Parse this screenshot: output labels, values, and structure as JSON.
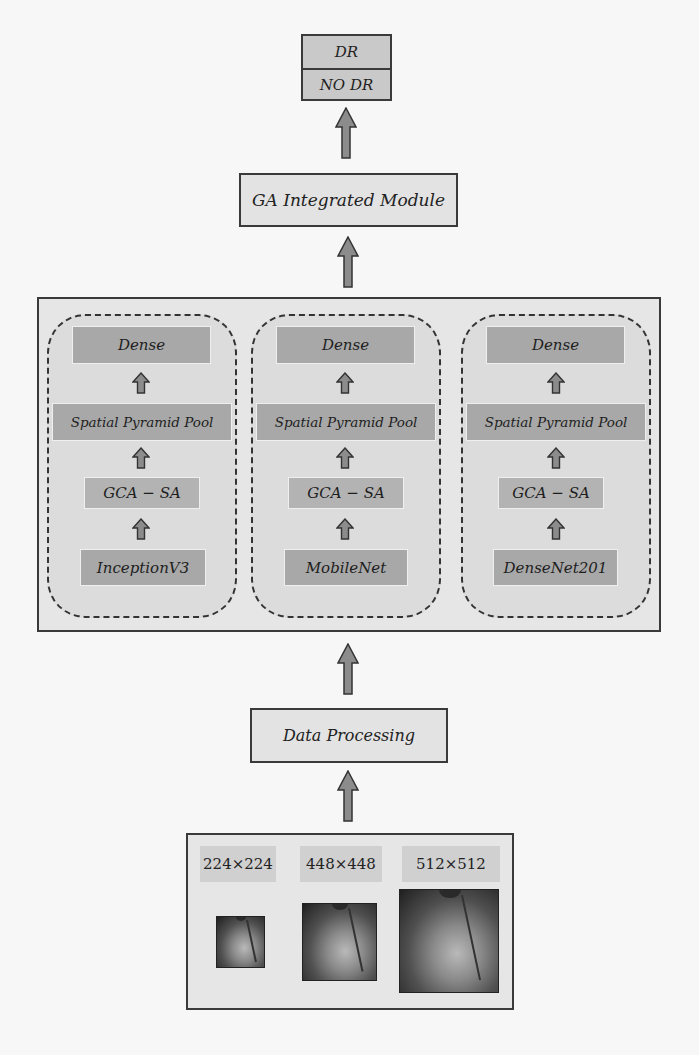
{
  "output": {
    "classes": [
      "DR",
      "NO DR"
    ]
  },
  "ga_module": {
    "label": "GA Integrated Module"
  },
  "columns": [
    {
      "dense": "Dense",
      "spp": "Spatial Pyramid Pool",
      "attention": "GCA − SA",
      "backbone": "InceptionV3"
    },
    {
      "dense": "Dense",
      "spp": "Spatial Pyramid Pool",
      "attention": "GCA − SA",
      "backbone": "MobileNet"
    },
    {
      "dense": "Dense",
      "spp": "Spatial Pyramid Pool",
      "attention": "GCA − SA",
      "backbone": "DenseNet201"
    }
  ],
  "data_processing": {
    "label": "Data Processing"
  },
  "inputs": [
    {
      "size_label": "224×224",
      "image": "retinal-fundus-image"
    },
    {
      "size_label": "448×448",
      "image": "retinal-fundus-image"
    },
    {
      "size_label": "512×512",
      "image": "retinal-fundus-image"
    }
  ],
  "colors": {
    "block_fill": "#a8a8a8",
    "container_fill": "#e6e6e6",
    "arrow_fill": "#8c8c8c",
    "border": "#3a3a3a"
  }
}
